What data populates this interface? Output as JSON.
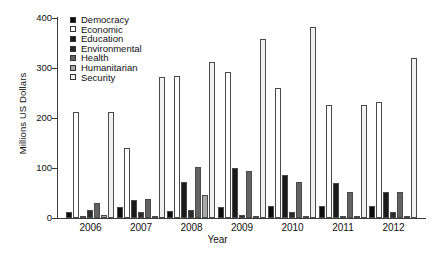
{
  "chart_data": {
    "type": "bar",
    "title": "",
    "xlabel": "Year",
    "ylabel": "Millions US Dollars",
    "categories": [
      "2006",
      "2007",
      "2008",
      "2009",
      "2010",
      "2011",
      "2012"
    ],
    "ylim": [
      0,
      400
    ],
    "yticks": [
      0,
      100,
      200,
      300,
      400
    ],
    "grid": false,
    "legend_position": "top-left",
    "series": [
      {
        "name": "Democracy",
        "color": "#0d0d0d",
        "values": [
          13,
          23,
          14,
          22,
          25,
          24,
          25
        ]
      },
      {
        "name": "Economic",
        "color": "#ffffff",
        "values": [
          212,
          140,
          285,
          292,
          260,
          227,
          232
        ]
      },
      {
        "name": "Education",
        "color": "#1a1a1a",
        "values": [
          5,
          37,
          72,
          100,
          87,
          70,
          53
        ]
      },
      {
        "name": "Environmental",
        "color": "#2b2b2b",
        "values": [
          16,
          12,
          16,
          6,
          12,
          5,
          12
        ]
      },
      {
        "name": "Health",
        "color": "#636363",
        "values": [
          30,
          38,
          102,
          95,
          72,
          53,
          53
        ]
      },
      {
        "name": "Humanitarian",
        "color": "#a8a8a8",
        "values": [
          6,
          5,
          46,
          4,
          5,
          4,
          4
        ]
      },
      {
        "name": "Security",
        "color": "#f0f0f0",
        "values": [
          212,
          283,
          312,
          358,
          383,
          227,
          320
        ]
      }
    ]
  },
  "axis": {
    "ytick_labels": [
      "400",
      "300",
      "200",
      "100",
      "0"
    ]
  },
  "legend": {
    "items": [
      {
        "label": "Democracy"
      },
      {
        "label": "Economic"
      },
      {
        "label": "Education"
      },
      {
        "label": "Environmental"
      },
      {
        "label": "Health"
      },
      {
        "label": "Humanitarian"
      },
      {
        "label": "Security"
      }
    ]
  }
}
